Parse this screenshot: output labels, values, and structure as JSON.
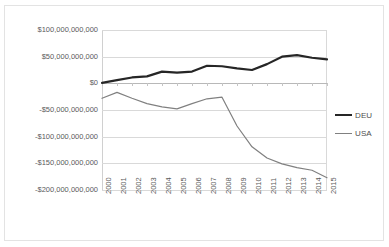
{
  "chart_data": {
    "type": "line",
    "title": "",
    "subtitle": "",
    "xlabel": "",
    "ylabel": "",
    "grid": true,
    "legend_position": "right",
    "ylim": [
      -200000000000,
      100000000000
    ],
    "ytick_step": 50000000000,
    "ytick_labels": [
      "$100,000,000,000",
      "$50,000,000,000",
      "$0",
      "-$50,000,000,000",
      "-$100,000,000,000",
      "-$150,000,000,000",
      "-$200,000,000,000"
    ],
    "ytick_values": [
      100000000000,
      50000000000,
      0,
      -50000000000,
      -100000000000,
      -150000000000,
      -200000000000
    ],
    "categories": [
      "2000",
      "2001",
      "2002",
      "2003",
      "2004",
      "2005",
      "2006",
      "2007",
      "2008",
      "2009",
      "2010",
      "2011",
      "2012",
      "2013",
      "2014",
      "2015"
    ],
    "x": [
      2000,
      2001,
      2002,
      2003,
      2004,
      2005,
      2006,
      2007,
      2008,
      2009,
      2010,
      2011,
      2012,
      2013,
      2014,
      2015
    ],
    "series": [
      {
        "name": "DEU",
        "color": "#262626",
        "line_width": 2.2,
        "values": [
          1000000000,
          6000000000,
          11000000000,
          13000000000,
          22000000000,
          20000000000,
          22000000000,
          33000000000,
          32000000000,
          28000000000,
          25000000000,
          36000000000,
          50000000000,
          53000000000,
          48000000000,
          45000000000
        ]
      },
      {
        "name": "USA",
        "color": "#808080",
        "line_width": 1.2,
        "values": [
          -28000000000,
          -17000000000,
          -28000000000,
          -38000000000,
          -44000000000,
          -48000000000,
          -38000000000,
          -29000000000,
          -26000000000,
          -80000000000,
          -119000000000,
          -140000000000,
          -151000000000,
          -158000000000,
          -163000000000,
          -177000000000
        ]
      }
    ]
  },
  "legend": {
    "items": [
      {
        "label": "DEU"
      },
      {
        "label": "USA"
      }
    ]
  }
}
